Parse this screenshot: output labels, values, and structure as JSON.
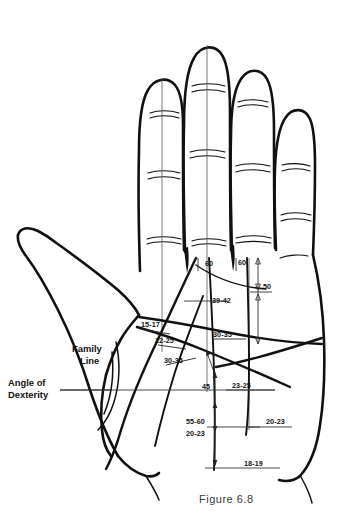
{
  "figure": {
    "caption": "Figure 6.8"
  },
  "named_labels": [
    {
      "id": "family-line",
      "lines": [
        "Family",
        "Line"
      ],
      "x": 72,
      "y": 352
    },
    {
      "id": "angle-of-dexterity",
      "lines": [
        "Angle of",
        "Dexterity"
      ],
      "x": 8,
      "y": 385
    }
  ],
  "measurements": [
    {
      "id": "m-60-middle",
      "text": "60",
      "x": 205,
      "y": 266
    },
    {
      "id": "m-60-ring",
      "text": "60",
      "x": 238,
      "y": 265
    },
    {
      "id": "m-50",
      "text": "50",
      "x": 263,
      "y": 289
    },
    {
      "id": "m-39-42",
      "text": "39-42",
      "x": 212,
      "y": 303
    },
    {
      "id": "m-15-17",
      "text": "15-17",
      "x": 141,
      "y": 327
    },
    {
      "id": "m-22-25",
      "text": "22-25",
      "x": 155,
      "y": 343
    },
    {
      "id": "m-30-35-palm",
      "text": "30-35",
      "x": 213,
      "y": 337
    },
    {
      "id": "m-30-35-low",
      "text": "30-35",
      "x": 164,
      "y": 363
    },
    {
      "id": "m-45",
      "text": "45",
      "x": 202,
      "y": 389
    },
    {
      "id": "m-23-25",
      "text": "23-25",
      "x": 232,
      "y": 388
    },
    {
      "id": "m-55-60",
      "text": "55-60",
      "x": 186,
      "y": 424
    },
    {
      "id": "m-20-23-left",
      "text": "20-23",
      "x": 186,
      "y": 436
    },
    {
      "id": "m-20-23-right",
      "text": "20-23",
      "x": 266,
      "y": 424
    },
    {
      "id": "m-18-19",
      "text": "18-19",
      "x": 244,
      "y": 466
    }
  ],
  "colors": {
    "ink": "#111111",
    "paper": "#ffffff",
    "axis": "#555555",
    "caption": "#3a3a3a"
  }
}
